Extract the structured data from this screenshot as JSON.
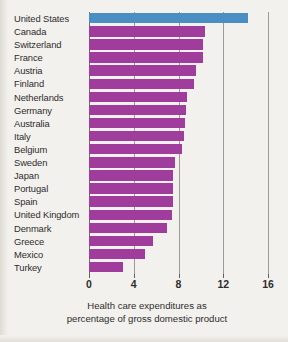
{
  "chart_data": {
    "type": "bar",
    "orientation": "horizontal",
    "title": "",
    "xlabel": "Health care expenditures as percentage of gross domestic product",
    "ylabel": "",
    "xlim": [
      0,
      16
    ],
    "xticks": [
      0,
      4,
      8,
      12,
      16
    ],
    "xtick_labels": [
      "0",
      "4",
      "8",
      "12",
      "16"
    ],
    "grid": "vertical gridlines at 4, 8, 12, 16",
    "legend": "none",
    "categories": [
      "United States",
      "Canada",
      "Switzerland",
      "France",
      "Austria",
      "Finland",
      "Netherlands",
      "Germany",
      "Australia",
      "Italy",
      "Belgium",
      "Sweden",
      "Japan",
      "Portugal",
      "Spain",
      "United Kingdom",
      "Denmark",
      "Greece",
      "Mexico",
      "Turkey"
    ],
    "values": [
      14.2,
      10.4,
      10.2,
      10.2,
      9.6,
      9.4,
      8.8,
      8.7,
      8.6,
      8.5,
      8.3,
      7.7,
      7.5,
      7.5,
      7.5,
      7.4,
      7.0,
      5.7,
      5.0,
      3.0
    ],
    "bar_colors": [
      "#4b8ec4",
      "#a03c9b",
      "#a03c9b",
      "#a03c9b",
      "#a03c9b",
      "#a03c9b",
      "#a03c9b",
      "#a03c9b",
      "#a03c9b",
      "#a03c9b",
      "#a03c9b",
      "#a03c9b",
      "#a03c9b",
      "#a03c9b",
      "#a03c9b",
      "#a03c9b",
      "#a03c9b",
      "#a03c9b",
      "#a03c9b",
      "#a03c9b"
    ],
    "highlight_category": "United States",
    "highlight_color": "#4b8ec4",
    "series_color": "#a03c9b"
  },
  "caption": {
    "line1": "Health care expenditures as",
    "line2": "percentage of gross domestic product"
  },
  "colors": {
    "background": "#f3f1ed",
    "text": "#2d2d2d",
    "gridline": "#9a9a9a",
    "axis": "#6f6f6f"
  }
}
